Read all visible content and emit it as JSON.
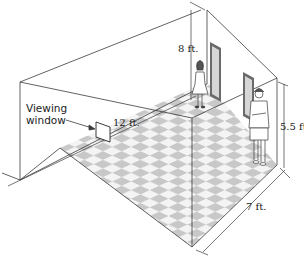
{
  "diagram": {
    "title": "",
    "labels": {
      "viewing_window_line1": "Viewing",
      "viewing_window_line2": "window",
      "length": "12 ft.",
      "height": "8 ft.",
      "person_height": "5.5 ft.",
      "width": "7 ft."
    },
    "elements": {
      "room": "room-outline",
      "floor": "checkered-floor",
      "window": "viewing-window",
      "paintings": [
        "painting-1",
        "painting-2"
      ],
      "people": [
        "girl-standing",
        "man-standing"
      ]
    },
    "colors": {
      "line": "#3a3a3a",
      "tile_dark": "#c8c8c8",
      "tile_light": "#f4f4f4",
      "frame": "#6a6a6a",
      "painting_fill": "#d6d6d6",
      "background": "#ffffff"
    }
  }
}
